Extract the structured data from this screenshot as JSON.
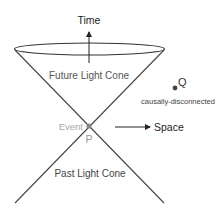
{
  "diagram": {
    "axes": {
      "time_label": "Time",
      "space_label": "Space"
    },
    "regions": {
      "future": "Future Light Cone",
      "past": "Past Light Cone"
    },
    "event": {
      "label": "Event",
      "point_label": "P"
    },
    "other_point": {
      "point_label": "Q",
      "description": "causally-disconnected"
    },
    "colors": {
      "lines": "#333333",
      "text": "#222222",
      "region_text": "#555555",
      "event_text": "#a8a8a8",
      "event_dot": "#888888",
      "point_q": "#444444"
    }
  }
}
